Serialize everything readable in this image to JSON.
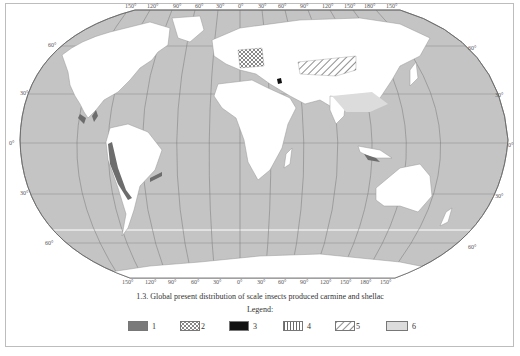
{
  "map": {
    "title": "1.3. Global present distribution of scale insects produced carmine and shellac",
    "projection": "pseudo-cylindrical world map",
    "ocean_color": "#c4c4c4",
    "land_color": "#ffffff",
    "longitude_labels_top": [
      "150°",
      "120°",
      "90°",
      "60°",
      "30°",
      "0°",
      "30°",
      "60°",
      "90°",
      "120°",
      "150°",
      "180°",
      "150°"
    ],
    "longitude_labels_bottom": [
      "150°",
      "120°",
      "90°",
      "60°",
      "30°",
      "0°",
      "30°",
      "60°",
      "90°",
      "120°",
      "150°",
      "180°",
      "150°"
    ],
    "latitude_labels_left": [
      "60°",
      "30°",
      "0°",
      "30°",
      "60°"
    ],
    "latitude_labels_right": [
      "60°",
      "30°",
      "0°",
      "30°",
      "60°"
    ]
  },
  "legend": {
    "title": "Legend:",
    "items": [
      {
        "number": "1",
        "pattern": "solid-dark-gray",
        "color": "#7a7a7a"
      },
      {
        "number": "2",
        "pattern": "cross-hatch",
        "color": "#ffffff"
      },
      {
        "number": "3",
        "pattern": "solid-black",
        "color": "#111111"
      },
      {
        "number": "4",
        "pattern": "vertical-lines",
        "color": "#ffffff"
      },
      {
        "number": "5",
        "pattern": "diagonal-lines",
        "color": "#ffffff"
      },
      {
        "number": "6",
        "pattern": "solid-light-gray",
        "color": "#dcdcdc"
      }
    ]
  }
}
